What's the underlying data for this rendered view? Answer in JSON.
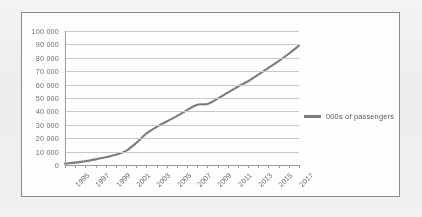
{
  "figure": {
    "background_color": "#f2f2f1",
    "panel_color": "#ffffff",
    "panel_border_color": "#8a8a8a",
    "line_color": "#7d7d7d",
    "grid_color": "#c9c9c9",
    "axis_color": "#9a9a9a",
    "label_color": "#6f6f6f"
  },
  "legend": {
    "position": "right",
    "entries": [
      {
        "label": "000s of passengers",
        "color": "#7d7d7d"
      }
    ]
  },
  "chart_data": {
    "type": "line",
    "title": "",
    "subtitle": "",
    "xlabel": "",
    "ylabel": "",
    "grid": true,
    "legend_position": "right",
    "xlim": [
      1995,
      2018
    ],
    "ylim": [
      0,
      100000
    ],
    "ytick_step": 10000,
    "ytick_labels": [
      "0",
      "10 000",
      "20 000",
      "30 000",
      "40 000",
      "50 000",
      "60 000",
      "70 000",
      "80 000",
      "90 000",
      "100 000"
    ],
    "ytick_values": [
      0,
      10000,
      20000,
      30000,
      40000,
      50000,
      60000,
      70000,
      80000,
      90000,
      100000
    ],
    "xtick_labels": [
      "1995",
      "1997",
      "1999",
      "2001",
      "2003",
      "2005",
      "2007",
      "2009",
      "2011",
      "2013",
      "2015",
      "2017"
    ],
    "x": [
      1995,
      1996,
      1997,
      1998,
      1999,
      2000,
      2001,
      2002,
      2003,
      2004,
      2005,
      2006,
      2007,
      2008,
      2009,
      2010,
      2011,
      2012,
      2013,
      2014,
      2015,
      2016,
      2017,
      2018
    ],
    "series": [
      {
        "name": "000s of passengers",
        "color": "#7d7d7d",
        "values": [
          1000,
          1800,
          2800,
          4200,
          5800,
          7600,
          10500,
          16500,
          23500,
          28500,
          32500,
          36500,
          41000,
          45000,
          45500,
          49500,
          54000,
          58500,
          62500,
          67500,
          72500,
          77500,
          83000,
          89000
        ]
      }
    ]
  }
}
